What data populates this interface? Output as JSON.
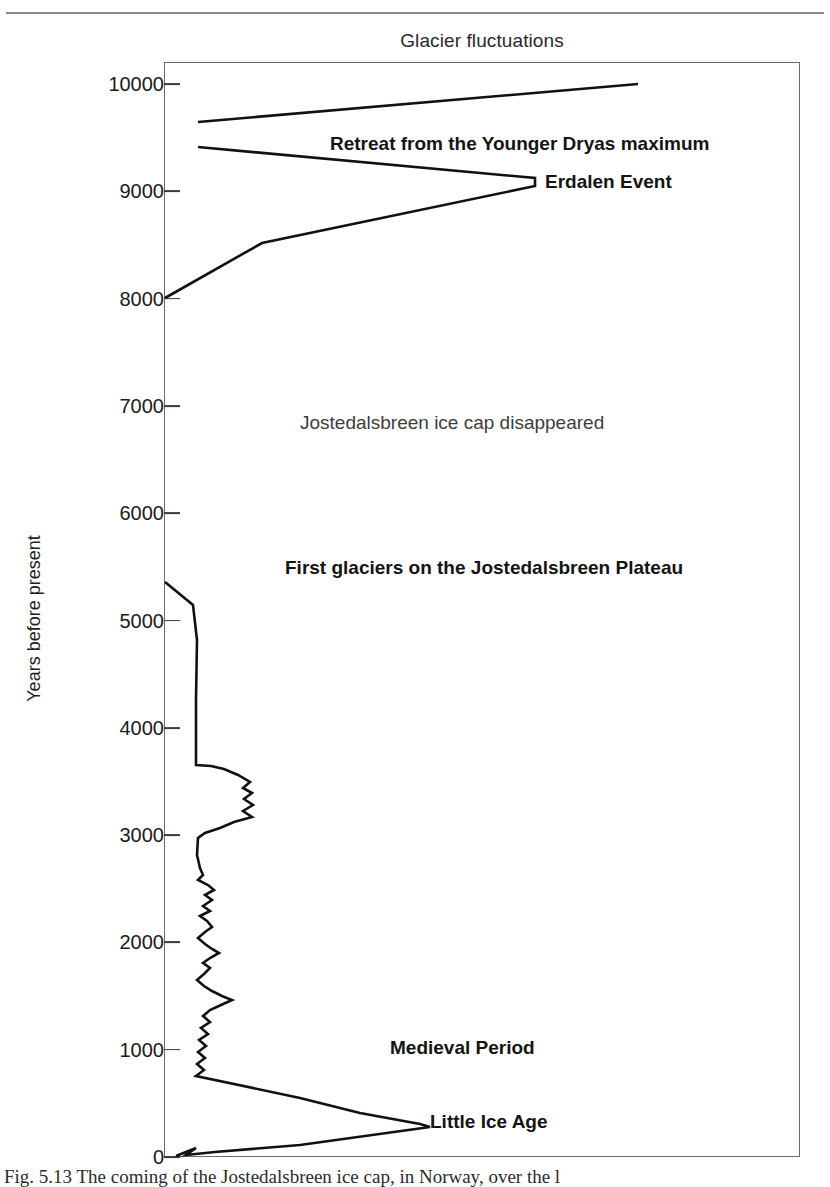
{
  "figure": {
    "caption": "Fig. 5.13  The coming of the Jostedalsbreen ice cap, in Norway, over the l"
  },
  "chart_data": {
    "type": "line",
    "title": "Glacier fluctuations",
    "xlabel": "",
    "ylabel": "Years before present",
    "ylim": [
      0,
      10000
    ],
    "xlim": [
      0,
      100
    ],
    "grid": false,
    "legend": "none",
    "y_ticks": [
      10000,
      9000,
      8000,
      7000,
      6000,
      5000,
      4000,
      3000,
      2000,
      1000,
      0
    ],
    "y_tick_labels": [
      "10000",
      "9000",
      "8000",
      "7000",
      "6000",
      "5000",
      "4000",
      "3000",
      "2000",
      "1000",
      "0"
    ],
    "x_axis_visible": false,
    "annotations": [
      {
        "text": "Retreat from the Younger Dryas maximum",
        "x_px": 330,
        "y_bp": 9430,
        "weight": "bold"
      },
      {
        "text": "Erdalen Event",
        "x_px": 545,
        "y_bp": 9080,
        "weight": "bold"
      },
      {
        "text": "Jostedalsbreen ice cap disappeared",
        "x_px": 300,
        "y_bp": 6830,
        "weight": "light"
      },
      {
        "text": "First glaciers on the Jostedalsbreen Plateau",
        "x_px": 285,
        "y_bp": 5480,
        "weight": "bold"
      },
      {
        "text": "Medieval Period",
        "x_px": 390,
        "y_bp": 1010,
        "weight": "bold"
      },
      {
        "text": "Little Ice Age",
        "x_px": 430,
        "y_bp": 320,
        "weight": "bold"
      }
    ],
    "series": [
      {
        "name": "Younger Dryas retreat",
        "comment": "Upper trace: glacier retreating from Younger Dryas maximum, 10000 to 9620 BP",
        "points_px": [
          [
            638,
            84
          ],
          [
            198,
            122
          ]
        ]
      },
      {
        "name": "Erdalen Event and ice cap disappearance",
        "comment": "Readvance to the Erdalen Event at about 9100 BP, then final retreat and disappearance by 8000 BP",
        "points_px": [
          [
            198,
            147
          ],
          [
            535,
            178
          ],
          [
            535,
            186
          ],
          [
            262,
            243
          ],
          [
            165,
            298
          ]
        ]
      },
      {
        "name": "Neoglacial growth and oscillations",
        "comment": "Regrowth of glaciers from about 5350 BP through Medieval Period to the Little Ice Age maximum near 300 BP and present-day retreat",
        "points_px": [
          [
            165,
            582
          ],
          [
            193,
            605
          ],
          [
            197,
            640
          ],
          [
            196,
            700
          ],
          [
            196,
            765
          ],
          [
            211,
            766
          ],
          [
            224,
            769
          ],
          [
            238,
            775
          ],
          [
            250,
            782
          ],
          [
            243,
            788
          ],
          [
            252,
            793
          ],
          [
            244,
            799
          ],
          [
            253,
            805
          ],
          [
            243,
            811
          ],
          [
            252,
            817
          ],
          [
            234,
            822
          ],
          [
            220,
            828
          ],
          [
            205,
            833
          ],
          [
            198,
            838
          ],
          [
            197,
            855
          ],
          [
            200,
            868
          ],
          [
            203,
            875
          ],
          [
            198,
            880
          ],
          [
            208,
            885
          ],
          [
            214,
            890
          ],
          [
            205,
            895
          ],
          [
            212,
            900
          ],
          [
            203,
            906
          ],
          [
            210,
            911
          ],
          [
            200,
            916
          ],
          [
            207,
            921
          ],
          [
            212,
            927
          ],
          [
            205,
            932
          ],
          [
            198,
            938
          ],
          [
            205,
            944
          ],
          [
            212,
            949
          ],
          [
            219,
            953
          ],
          [
            210,
            958
          ],
          [
            203,
            963
          ],
          [
            210,
            968
          ],
          [
            204,
            974
          ],
          [
            197,
            980
          ],
          [
            204,
            986
          ],
          [
            212,
            991
          ],
          [
            222,
            996
          ],
          [
            232,
            1000
          ],
          [
            221,
            1005
          ],
          [
            210,
            1010
          ],
          [
            203,
            1016
          ],
          [
            210,
            1022
          ],
          [
            201,
            1028
          ],
          [
            208,
            1034
          ],
          [
            199,
            1040
          ],
          [
            206,
            1046
          ],
          [
            198,
            1052
          ],
          [
            205,
            1058
          ],
          [
            197,
            1064
          ],
          [
            204,
            1070
          ],
          [
            196,
            1076
          ],
          [
            300,
            1098
          ],
          [
            360,
            1113
          ],
          [
            420,
            1124
          ],
          [
            430,
            1127
          ],
          [
            300,
            1145
          ],
          [
            215,
            1152
          ],
          [
            186,
            1155
          ],
          [
            196,
            1148
          ],
          [
            176,
            1156
          ]
        ]
      }
    ]
  }
}
